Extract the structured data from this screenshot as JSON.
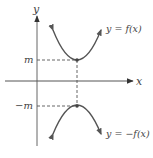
{
  "figure": {
    "axes": {
      "x_label": "x",
      "y_label": "y"
    },
    "ticks": {
      "m_label": "m",
      "neg_m_label": "−m"
    },
    "curves": [
      {
        "name": "f",
        "label_prefix": "y = ",
        "label_fn": "f",
        "label_arg": "(x)"
      },
      {
        "name": "neg-f",
        "label_prefix": "y = ",
        "label_neg": "−",
        "label_fn": "f",
        "label_arg": "(x)"
      }
    ],
    "colors": {
      "curve": "#555555",
      "axis": "#555555",
      "dashed": "#555555",
      "text": "#444444"
    }
  }
}
